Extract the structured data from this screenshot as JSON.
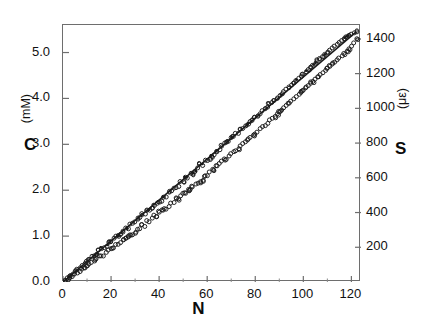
{
  "chart_data": {
    "type": "scatter",
    "title": "",
    "xlabel": "N",
    "ylabel": "C",
    "ylabel_unit": "(mM)",
    "y2label": "S",
    "y2label_unit": "(με)",
    "xlim": [
      0,
      124
    ],
    "ylim": [
      0,
      5.6
    ],
    "y2lim": [
      0,
      1480
    ],
    "grid": false,
    "legend": null,
    "xticks": [
      0,
      20,
      40,
      60,
      80,
      100,
      120
    ],
    "xticklabels": [
      "0",
      "20",
      "40",
      "60",
      "80",
      "100",
      "120"
    ],
    "yticks": [
      0.0,
      1.0,
      2.0,
      3.0,
      4.0,
      5.0
    ],
    "yticklabels": [
      "0.0",
      "1.0",
      "2.0",
      "3.0",
      "4.0",
      "5.0"
    ],
    "y2ticks": [
      200,
      400,
      600,
      800,
      1000,
      1200,
      1400
    ],
    "y2ticklabels": [
      "200",
      "400",
      "600",
      "800",
      "1000",
      "1200",
      "1400"
    ],
    "marker_style": "open-circle",
    "marker_color": "#1a1a1a",
    "line_color": "#1a1a1a",
    "reference_line": {
      "name": "linear reference line",
      "x": [
        0,
        122
      ],
      "y": [
        0.0,
        5.45
      ]
    },
    "series": [
      {
        "name": "upper band",
        "marker": "open-circle",
        "x": [
          1,
          2,
          3,
          4,
          5,
          6,
          7,
          8,
          9,
          10,
          11,
          12,
          13,
          14,
          15,
          16,
          17,
          18,
          19,
          20,
          21,
          22,
          23,
          24,
          25,
          26,
          27,
          28,
          29,
          30,
          31,
          32,
          33,
          34,
          35,
          36,
          37,
          38,
          39,
          40,
          41,
          42,
          43,
          44,
          45,
          46,
          47,
          48,
          49,
          50,
          51,
          52,
          53,
          54,
          55,
          56,
          57,
          58,
          59,
          60,
          61,
          62,
          63,
          64,
          65,
          66,
          67,
          68,
          69,
          70,
          71,
          72,
          73,
          74,
          75,
          76,
          77,
          78,
          79,
          80,
          81,
          82,
          83,
          84,
          85,
          86,
          87,
          88,
          89,
          90,
          91,
          92,
          93,
          94,
          95,
          96,
          97,
          98,
          99,
          100,
          101,
          102,
          103,
          104,
          105,
          106,
          107,
          108,
          109,
          110,
          111,
          112,
          113,
          114,
          115,
          116,
          117,
          118,
          119,
          120,
          121,
          122
        ],
        "y": [
          0.04,
          0.09,
          0.14,
          0.17,
          0.24,
          0.28,
          0.31,
          0.37,
          0.41,
          0.45,
          0.49,
          0.56,
          0.58,
          0.62,
          0.7,
          0.72,
          0.74,
          0.8,
          0.86,
          0.88,
          0.93,
          0.97,
          1.02,
          1.05,
          1.1,
          1.16,
          1.18,
          1.24,
          1.27,
          1.33,
          1.36,
          1.41,
          1.46,
          1.49,
          1.55,
          1.58,
          1.63,
          1.68,
          1.71,
          1.77,
          1.8,
          1.86,
          1.89,
          1.95,
          1.98,
          2.03,
          2.08,
          2.11,
          2.17,
          2.21,
          2.25,
          2.3,
          2.34,
          2.39,
          2.44,
          2.47,
          2.53,
          2.57,
          2.62,
          2.66,
          2.7,
          2.76,
          2.79,
          2.85,
          2.89,
          2.96,
          3.0,
          3.03,
          3.08,
          3.13,
          3.17,
          3.22,
          3.26,
          3.31,
          3.36,
          3.4,
          3.45,
          3.5,
          3.54,
          3.59,
          3.63,
          3.68,
          3.73,
          3.77,
          3.82,
          3.87,
          3.92,
          3.96,
          4.01,
          4.06,
          4.1,
          4.15,
          4.2,
          4.25,
          4.29,
          4.34,
          4.39,
          4.44,
          4.48,
          4.53,
          4.58,
          4.63,
          4.68,
          4.72,
          4.77,
          4.82,
          4.87,
          4.91,
          4.96,
          5.01,
          5.05,
          5.1,
          5.14,
          5.18,
          5.22,
          5.26,
          5.3,
          5.34,
          5.37,
          5.4,
          5.43,
          5.45
        ]
      },
      {
        "name": "lower band",
        "marker": "open-circle",
        "x": [
          1,
          2,
          3,
          4,
          5,
          6,
          7,
          8,
          9,
          10,
          11,
          12,
          13,
          14,
          15,
          16,
          17,
          18,
          19,
          20,
          21,
          22,
          23,
          24,
          25,
          26,
          27,
          28,
          29,
          30,
          31,
          32,
          33,
          34,
          35,
          36,
          37,
          38,
          39,
          40,
          41,
          42,
          43,
          44,
          45,
          46,
          47,
          48,
          49,
          50,
          51,
          52,
          53,
          54,
          55,
          56,
          57,
          58,
          59,
          60,
          61,
          62,
          63,
          64,
          65,
          66,
          67,
          68,
          69,
          70,
          71,
          72,
          73,
          74,
          75,
          76,
          77,
          78,
          79,
          80,
          81,
          82,
          83,
          84,
          85,
          86,
          87,
          88,
          89,
          90,
          91,
          92,
          93,
          94,
          95,
          96,
          97,
          98,
          99,
          100,
          101,
          102,
          103,
          104,
          105,
          106,
          107,
          108,
          109,
          110,
          111,
          112,
          113,
          114,
          115,
          116,
          117,
          118,
          119,
          120,
          121,
          122
        ],
        "y": [
          0.02,
          0.05,
          0.09,
          0.12,
          0.17,
          0.2,
          0.23,
          0.28,
          0.31,
          0.34,
          0.38,
          0.43,
          0.45,
          0.49,
          0.55,
          0.57,
          0.59,
          0.64,
          0.69,
          0.71,
          0.75,
          0.79,
          0.83,
          0.86,
          0.9,
          0.95,
          0.97,
          1.02,
          1.05,
          1.1,
          1.13,
          1.17,
          1.22,
          1.25,
          1.3,
          1.33,
          1.37,
          1.42,
          1.45,
          1.5,
          1.53,
          1.58,
          1.61,
          1.66,
          1.69,
          1.74,
          1.78,
          1.81,
          1.86,
          1.9,
          1.94,
          1.99,
          2.03,
          2.07,
          2.12,
          2.15,
          2.2,
          2.24,
          2.29,
          2.33,
          2.37,
          2.42,
          2.45,
          2.51,
          2.55,
          2.61,
          2.65,
          2.68,
          2.73,
          2.78,
          2.82,
          2.87,
          2.91,
          2.96,
          3.01,
          3.05,
          3.1,
          3.15,
          3.19,
          3.24,
          3.28,
          3.33,
          3.38,
          3.42,
          3.47,
          3.52,
          3.57,
          3.61,
          3.66,
          3.71,
          3.75,
          3.8,
          3.85,
          3.9,
          3.94,
          3.99,
          4.04,
          4.09,
          4.13,
          4.18,
          4.23,
          4.28,
          4.33,
          4.37,
          4.42,
          4.47,
          4.52,
          4.56,
          4.61,
          4.66,
          4.7,
          4.75,
          4.79,
          4.84,
          4.88,
          4.93,
          4.98,
          5.03,
          5.08,
          5.14,
          5.21,
          5.3
        ]
      }
    ]
  }
}
